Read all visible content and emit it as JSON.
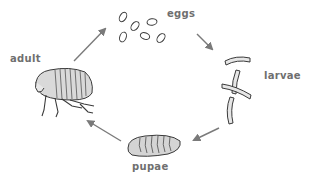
{
  "diagram": {
    "stages": [
      {
        "id": "eggs",
        "label": "eggs",
        "icon": "eggs-icon"
      },
      {
        "id": "larvae",
        "label": "larvae",
        "icon": "larvae-icon"
      },
      {
        "id": "pupae",
        "label": "pupae",
        "icon": "pupa-icon"
      },
      {
        "id": "adult",
        "label": "adult",
        "icon": "adult-flea-icon"
      }
    ],
    "arrows": [
      {
        "from": "eggs",
        "to": "larvae"
      },
      {
        "from": "larvae",
        "to": "pupae"
      },
      {
        "from": "pupae",
        "to": "adult"
      },
      {
        "from": "adult",
        "to": "eggs"
      }
    ],
    "colors": {
      "label": "#6f6f6f",
      "arrow": "#7a7a7a",
      "outline": "#3a3a3a",
      "fill": "#d9d9d9"
    }
  }
}
